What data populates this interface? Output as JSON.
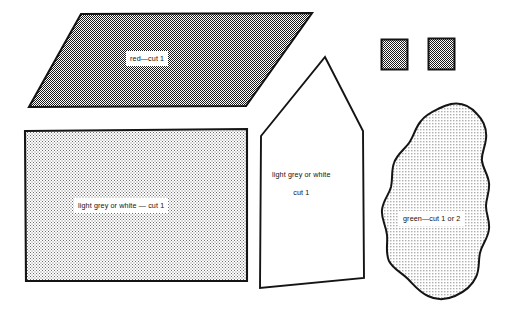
{
  "diagram": {
    "background_color": "#ffffff",
    "ink_color": "#141414",
    "pieces": [
      {
        "id": "roof",
        "name": "roof-parallelogram",
        "shape": "parallelogram",
        "label": "red—cut 1",
        "fill_style": "dark-checker",
        "fill_color": "#5f5f5f",
        "material": "red",
        "cut_count": "1"
      },
      {
        "id": "base",
        "name": "base-rectangle",
        "shape": "rectangle",
        "label": "light grey or white — cut 1",
        "fill_style": "light-checker",
        "fill_color": "#d9d9d9",
        "material": "light grey or white",
        "cut_count": "1"
      },
      {
        "id": "house",
        "name": "house-pentagon",
        "shape": "pentagon",
        "label_line_1": "light grey or white",
        "label_line_2": "cut 1",
        "fill_style": "none",
        "fill_color": "#ffffff",
        "material": "light grey or white",
        "cut_count": "1"
      },
      {
        "id": "square-left",
        "name": "small-square-left",
        "shape": "square",
        "label": "",
        "fill_style": "dark-checker",
        "fill_color": "#6a6a6a",
        "material": "",
        "cut_count": ""
      },
      {
        "id": "square-right",
        "name": "small-square-right",
        "shape": "square",
        "label": "",
        "fill_style": "dark-checker",
        "fill_color": "#6a6a6a",
        "material": "",
        "cut_count": ""
      },
      {
        "id": "blob",
        "name": "tree-blob",
        "shape": "organic-blob",
        "label": "green—cut 1 or 2",
        "fill_style": "dotted",
        "fill_color": "#eeeeee",
        "material": "green",
        "cut_count": "1 or 2"
      }
    ]
  },
  "labels": {
    "roof": "red—cut 1",
    "base": "light grey or white — cut 1",
    "house_line_1": "light grey or white",
    "house_line_2": "cut 1",
    "blob": "green—cut 1 or 2"
  }
}
